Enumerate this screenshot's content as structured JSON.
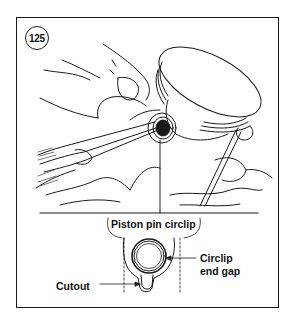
{
  "figure": {
    "number": "125",
    "labels": {
      "piston_pin_circlip": "Piston pin circlip",
      "circlip_end_gap_line1": "Circlip",
      "circlip_end_gap_line2": "end gap",
      "cutout": "Cutout"
    }
  },
  "colors": {
    "ink": "#1a1a1a",
    "background": "#ffffff"
  }
}
